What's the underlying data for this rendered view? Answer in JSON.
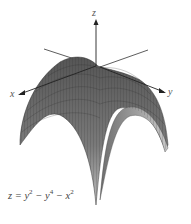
{
  "figure": {
    "equation": {
      "lhs": "z",
      "eq": " = ",
      "t1": "y",
      "p1": "2",
      "m1": " − ",
      "t2": "y",
      "p2": "4",
      "m2": " − ",
      "t3": "x",
      "p3": "2"
    },
    "axes": {
      "x_label": "x",
      "y_label": "y",
      "z_label": "z"
    },
    "colors": {
      "surface_dark": "#5a5a5a",
      "surface_light": "#bdbdbd",
      "mesh": "#2e2e2e",
      "axis": "#333333"
    }
  }
}
